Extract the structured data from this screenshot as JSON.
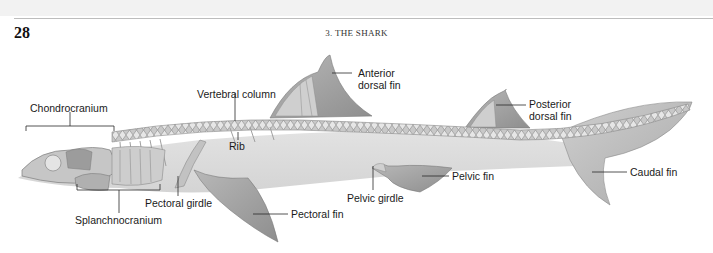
{
  "page": {
    "number": "28",
    "running_head": "3. THE SHARK"
  },
  "figure": {
    "colors": {
      "body_shadow": "#d9d9d9",
      "fin": "#9a9a9a",
      "fin_light": "#c4c4c4",
      "skeleton": "#b5b5b5",
      "leader_line": "#2a2a2a",
      "label_text": "#1a1a1a"
    },
    "labels": {
      "chondrocranium": "Chondrocranium",
      "vertebral_column": "Vertebral column",
      "anterior_dorsal_fin_line1": "Anterior",
      "anterior_dorsal_fin_line2": "dorsal fin",
      "posterior_dorsal_fin_line1": "Posterior",
      "posterior_dorsal_fin_line2": "dorsal fin",
      "rib": "Rib",
      "caudal_fin": "Caudal fin",
      "pelvic_fin": "Pelvic fin",
      "pelvic_girdle": "Pelvic girdle",
      "pectoral_girdle": "Pectoral girdle",
      "pectoral_fin": "Pectoral fin",
      "splanchnocranium": "Splanchnocranium"
    }
  }
}
